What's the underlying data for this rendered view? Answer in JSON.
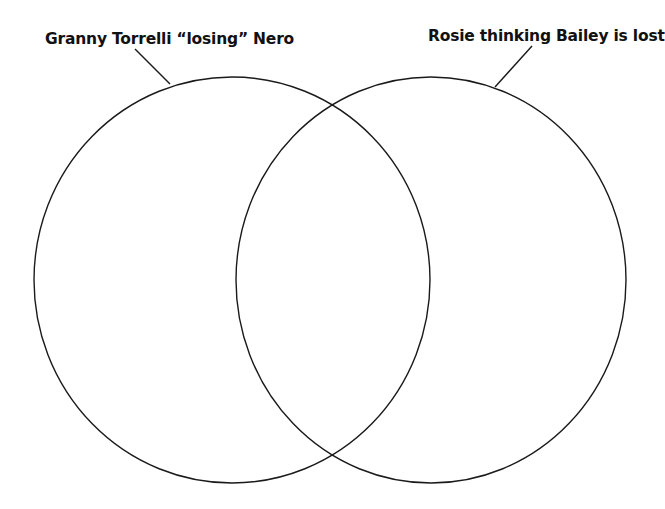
{
  "diagram": {
    "type": "venn",
    "sets": [
      {
        "id": "left",
        "label": "Granny Torrelli “losing” Nero",
        "circle": {
          "cx": 232,
          "cy": 280,
          "rx": 198,
          "ry": 203
        },
        "leader_line": {
          "x1": 135,
          "y1": 49,
          "x2": 170,
          "y2": 84
        }
      },
      {
        "id": "right",
        "label": "Rosie thinking Bailey is lost",
        "circle": {
          "cx": 431,
          "cy": 280,
          "rx": 195,
          "ry": 203
        },
        "leader_line": {
          "x1": 532,
          "y1": 46,
          "x2": 495,
          "y2": 87
        }
      }
    ],
    "colors": {
      "stroke": "#1a1a1a",
      "text": "#111111",
      "background": "#ffffff"
    }
  }
}
